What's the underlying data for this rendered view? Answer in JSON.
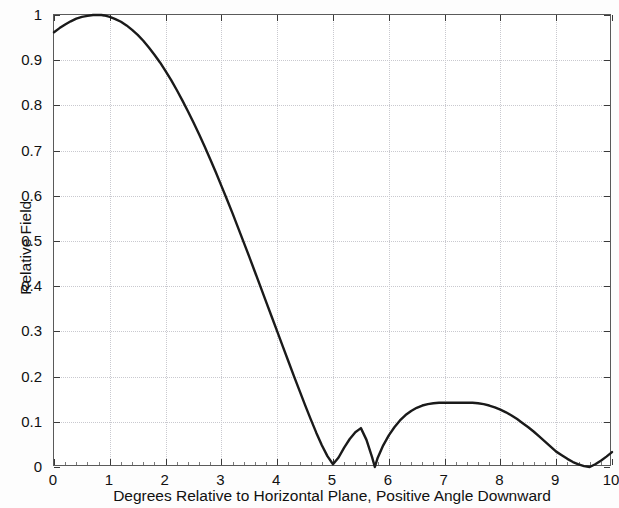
{
  "chart_data": {
    "type": "line",
    "title": "",
    "xlabel": "Degrees Relative to Horizontal Plane, Positive Angle Downward",
    "ylabel": "Relative Field",
    "xlim": [
      0,
      10
    ],
    "ylim": [
      0,
      1
    ],
    "grid": true,
    "legend": null,
    "xticks": [
      0,
      1,
      2,
      3,
      4,
      5,
      6,
      7,
      8,
      9,
      10
    ],
    "xtick_labels": [
      "0",
      "1",
      "2",
      "3",
      "4",
      "5",
      "6",
      "7",
      "8",
      "9",
      "10"
    ],
    "yticks": [
      0,
      0.1,
      0.2,
      0.3,
      0.4,
      0.5,
      0.6,
      0.7,
      0.8,
      0.9,
      1
    ],
    "ytick_labels": [
      "0",
      "0.1",
      "0.2",
      "0.3",
      "0.4",
      "0.5",
      "0.6",
      "0.7",
      "0.8",
      "0.9",
      "1"
    ],
    "line_color": "#1a1a1a",
    "line_width": 2.4,
    "series": [
      {
        "name": "Relative Field",
        "x": [
          0.0,
          0.1,
          0.2,
          0.3,
          0.4,
          0.5,
          0.6,
          0.7,
          0.8,
          0.85,
          0.9,
          1.0,
          1.1,
          1.2,
          1.3,
          1.4,
          1.5,
          1.6,
          1.7,
          1.8,
          1.9,
          2.0,
          2.1,
          2.2,
          2.3,
          2.4,
          2.5,
          2.6,
          2.7,
          2.8,
          2.9,
          3.0,
          3.1,
          3.2,
          3.3,
          3.4,
          3.5,
          3.6,
          3.7,
          3.8,
          3.9,
          4.0,
          4.1,
          4.2,
          4.3,
          4.4,
          4.5,
          4.6,
          4.7,
          4.8,
          4.9,
          5.0,
          5.1,
          5.2,
          5.3,
          5.4,
          5.5,
          5.6,
          5.7,
          5.75,
          5.8,
          5.9,
          6.0,
          6.1,
          6.2,
          6.3,
          6.4,
          6.5,
          6.6,
          6.7,
          6.8,
          6.9,
          7.0,
          7.1,
          7.2,
          7.3,
          7.4,
          7.5,
          7.6,
          7.7,
          7.8,
          7.9,
          8.0,
          8.1,
          8.2,
          8.3,
          8.4,
          8.5,
          8.6,
          8.7,
          8.8,
          8.9,
          9.0,
          9.1,
          9.2,
          9.3,
          9.4,
          9.5,
          9.6,
          9.7,
          9.8,
          9.9,
          10.0
        ],
        "y": [
          0.962,
          0.971,
          0.979,
          0.986,
          0.992,
          0.996,
          0.998,
          1.0,
          1.0,
          1.0,
          0.999,
          0.996,
          0.991,
          0.985,
          0.977,
          0.967,
          0.956,
          0.943,
          0.928,
          0.912,
          0.895,
          0.876,
          0.856,
          0.834,
          0.811,
          0.787,
          0.762,
          0.736,
          0.709,
          0.681,
          0.652,
          0.622,
          0.592,
          0.561,
          0.529,
          0.497,
          0.465,
          0.432,
          0.399,
          0.366,
          0.333,
          0.3,
          0.267,
          0.234,
          0.201,
          0.169,
          0.137,
          0.106,
          0.076,
          0.048,
          0.024,
          0.006,
          0.021,
          0.043,
          0.062,
          0.077,
          0.086,
          0.06,
          0.022,
          0.0,
          0.02,
          0.048,
          0.07,
          0.088,
          0.103,
          0.115,
          0.124,
          0.131,
          0.136,
          0.139,
          0.141,
          0.142,
          0.142,
          0.142,
          0.142,
          0.142,
          0.142,
          0.142,
          0.141,
          0.139,
          0.136,
          0.132,
          0.127,
          0.121,
          0.114,
          0.106,
          0.097,
          0.088,
          0.078,
          0.067,
          0.056,
          0.045,
          0.034,
          0.026,
          0.018,
          0.011,
          0.006,
          0.002,
          0.0,
          0.006,
          0.014,
          0.023,
          0.033
        ]
      }
    ],
    "annotations": {
      "main_lobe_peak": {
        "x": 0.85,
        "y": 1.0
      },
      "first_null": {
        "x": 5.75,
        "y": 0.0
      },
      "sidelobe_peak": {
        "x": 7.45,
        "y": 0.142
      },
      "second_null": {
        "x": 9.6,
        "y": 0.0
      }
    }
  }
}
